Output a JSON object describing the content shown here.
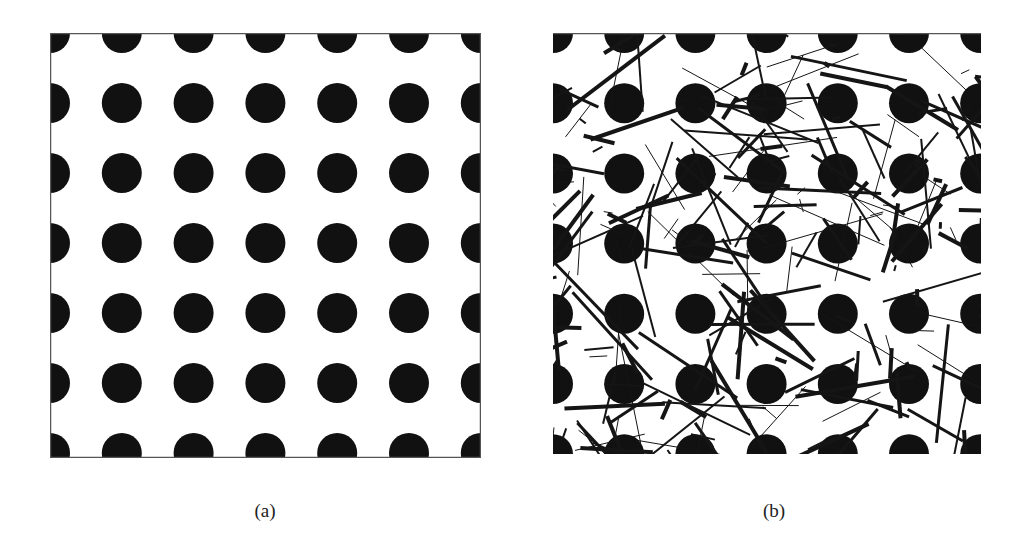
{
  "figure": {
    "panels": [
      {
        "id": "a",
        "caption": "(a)",
        "description": "Regular square grid of black dots",
        "frame": {
          "x": 50,
          "y": 33,
          "width": 431,
          "height": 425,
          "border": true,
          "border_color": "#555555"
        },
        "dot_grid": {
          "cols": 7,
          "rows": 7,
          "spacing_x": 71.8,
          "spacing_y": 70,
          "origin_x": 0,
          "origin_y": 0,
          "radius": 20,
          "color": "#111111"
        },
        "occluding_lines": {
          "count": 0
        }
      },
      {
        "id": "b",
        "caption": "(b)",
        "description": "Same dot grid overlaid with random occluding line segments",
        "frame": {
          "x": 553,
          "y": 33,
          "width": 428,
          "height": 421,
          "border": false,
          "top_border": true,
          "border_color": "#555555"
        },
        "dot_grid": {
          "cols": 7,
          "rows": 7,
          "spacing_x": 71.2,
          "spacing_y": 70.2,
          "origin_x": 0,
          "origin_y": 0,
          "radius": 20,
          "color": "#111111"
        },
        "occluding_lines": {
          "count": 260,
          "seed": 7,
          "min_length": 6,
          "max_length": 130,
          "min_width": 1,
          "max_width": 4,
          "color": "#151515"
        }
      }
    ]
  }
}
